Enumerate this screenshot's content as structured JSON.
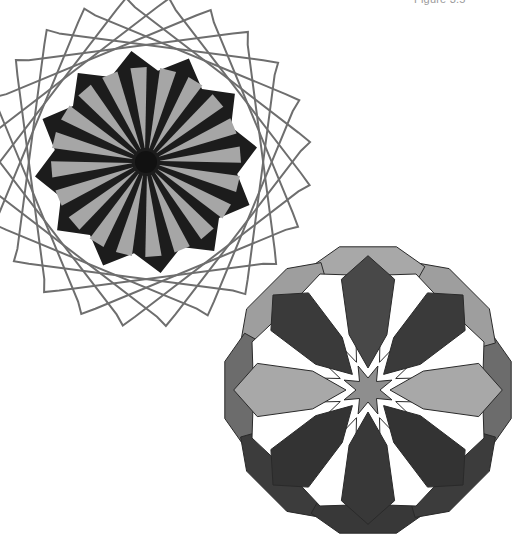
{
  "caption": "Figure 3.5",
  "figure_1": {
    "name": "twelve-point star rosette with ring of rotated squares",
    "center": [
      146,
      162
    ],
    "star_points": 12,
    "star_outer_radius": 112,
    "star_inner_radius": 92,
    "spoke_count": 20,
    "spoke_inner_radius": 14,
    "spoke_outer_radius": 95,
    "hub_radius": 11,
    "ring_squares": 6,
    "ring_square_half_size": 118,
    "ring_stroke_width": 2,
    "colors": {
      "star": "#1c1c1c",
      "spoke": "#a6a6a6",
      "hub": "#111111",
      "ring": "#6e6e6e"
    }
  },
  "figure_2": {
    "name": "eight-petal overlapping rosette",
    "center": [
      368,
      390
    ],
    "outer_radius": 146,
    "petal_count": 8,
    "center_star_radius": 26,
    "center_star_inner": 12,
    "colors": {
      "outline": "#2a2a2a",
      "center_star": "#8e8e8e",
      "white": "#ffffff",
      "ring": [
        "#6c6c6c",
        "#9e9e9e",
        "#a8a8a8",
        "#9e9e9e",
        "#6c6c6c",
        "#3c3c3c",
        "#383838",
        "#3c3c3c"
      ],
      "petals": [
        "#a8a8a8",
        "#3a3a3a",
        "#484848",
        "#3a3a3a",
        "#a8a8a8",
        "#333333",
        "#383838",
        "#333333"
      ]
    }
  }
}
